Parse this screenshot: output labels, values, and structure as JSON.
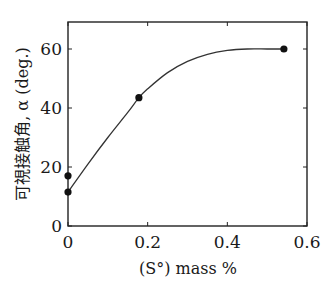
{
  "chart_data": {
    "type": "line",
    "title": "",
    "xlabel": "(S°)  mass %",
    "ylabel": "可視接触角, α (deg.)",
    "xlim": [
      0,
      0.6
    ],
    "ylim": [
      0,
      70
    ],
    "xticks": [
      0,
      0.2,
      0.4,
      0.6
    ],
    "xtick_labels": [
      "0",
      "0.2",
      "0.4",
      "0.6"
    ],
    "yticks": [
      0,
      20,
      40,
      60
    ],
    "ytick_labels": [
      "0",
      "20",
      "40",
      "60"
    ],
    "grid": false,
    "legend": null,
    "series": [
      {
        "name": "measured",
        "style": "markers",
        "x": [
          0,
          0,
          0.178,
          0.542
        ],
        "y": [
          11.5,
          17,
          43.5,
          60
        ]
      },
      {
        "name": "fitted curve",
        "style": "smooth-line",
        "x": [
          0,
          0.05,
          0.1,
          0.15,
          0.178,
          0.2,
          0.25,
          0.3,
          0.35,
          0.4,
          0.45,
          0.5,
          0.542
        ],
        "y": [
          11.5,
          21,
          30,
          38.5,
          43.5,
          46.5,
          52,
          55.8,
          58.2,
          59.5,
          60,
          60,
          60
        ]
      }
    ]
  }
}
